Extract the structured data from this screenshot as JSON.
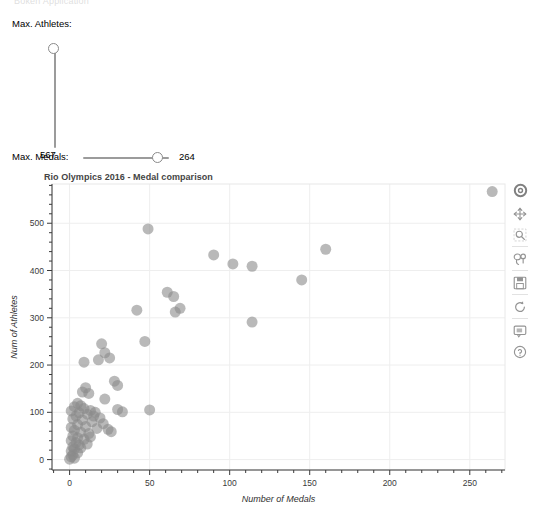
{
  "clipped_header": "Bokeh Application",
  "sliders": {
    "athletes": {
      "label": "Max. Athletes:",
      "value": "567",
      "orientation": "vertical",
      "min": 0,
      "max": 567,
      "handle_name": "max-athletes-slider-handle"
    },
    "medals": {
      "label": "Max. Medals:",
      "value": "264",
      "orientation": "horizontal",
      "min": 0,
      "max": 264,
      "handle_name": "max-medals-slider-handle"
    }
  },
  "toolbar": {
    "items": [
      {
        "icon": "bokeh-logo-icon",
        "label": "Bokeh"
      },
      {
        "icon": "pan-move-icon",
        "label": "Pan"
      },
      {
        "icon": "box-zoom-icon",
        "label": "Box Zoom"
      },
      {
        "icon": "lasso-select-icon",
        "label": "Lasso Select"
      },
      {
        "icon": "save-disk-icon",
        "label": "Save"
      },
      {
        "icon": "reset-icon",
        "label": "Reset"
      },
      {
        "icon": "hover-icon",
        "label": "Hover"
      },
      {
        "icon": "help-icon",
        "label": "Help"
      }
    ]
  },
  "chart_data": {
    "type": "scatter",
    "title": "Rio Olympics 2016 - Medal comparison",
    "xlabel": "Number of Medals",
    "ylabel": "Num of Athletes",
    "xlim": [
      -11,
      272
    ],
    "ylim": [
      -22,
      583
    ],
    "xticks": [
      0,
      50,
      100,
      150,
      200,
      250
    ],
    "yticks": [
      0,
      100,
      200,
      300,
      400,
      500
    ],
    "grid": true,
    "legend": "none",
    "marker": "circle",
    "marker_size": 11,
    "marker_color": "#8a8a8a",
    "marker_alpha": 0.6,
    "points": [
      {
        "x": 264,
        "y": 567
      },
      {
        "x": 49,
        "y": 488
      },
      {
        "x": 90,
        "y": 433
      },
      {
        "x": 160,
        "y": 445
      },
      {
        "x": 102,
        "y": 414
      },
      {
        "x": 114,
        "y": 409
      },
      {
        "x": 145,
        "y": 380
      },
      {
        "x": 61,
        "y": 354
      },
      {
        "x": 65,
        "y": 345
      },
      {
        "x": 42,
        "y": 316
      },
      {
        "x": 69,
        "y": 320
      },
      {
        "x": 66,
        "y": 312
      },
      {
        "x": 114,
        "y": 291
      },
      {
        "x": 47,
        "y": 250
      },
      {
        "x": 20,
        "y": 245
      },
      {
        "x": 22,
        "y": 226
      },
      {
        "x": 25,
        "y": 215
      },
      {
        "x": 18,
        "y": 211
      },
      {
        "x": 9,
        "y": 206
      },
      {
        "x": 28,
        "y": 166
      },
      {
        "x": 30,
        "y": 157
      },
      {
        "x": 10,
        "y": 152
      },
      {
        "x": 8,
        "y": 143
      },
      {
        "x": 12,
        "y": 140
      },
      {
        "x": 22,
        "y": 128
      },
      {
        "x": 50,
        "y": 105
      },
      {
        "x": 30,
        "y": 106
      },
      {
        "x": 33,
        "y": 101
      },
      {
        "x": 5,
        "y": 119
      },
      {
        "x": 7,
        "y": 114
      },
      {
        "x": 3,
        "y": 112
      },
      {
        "x": 9,
        "y": 108
      },
      {
        "x": 13,
        "y": 104
      },
      {
        "x": 1,
        "y": 103
      },
      {
        "x": 16,
        "y": 100
      },
      {
        "x": 6,
        "y": 99
      },
      {
        "x": 11,
        "y": 96
      },
      {
        "x": 4,
        "y": 92
      },
      {
        "x": 19,
        "y": 88
      },
      {
        "x": 2,
        "y": 86
      },
      {
        "x": 8,
        "y": 84
      },
      {
        "x": 14,
        "y": 80
      },
      {
        "x": 26,
        "y": 59
      },
      {
        "x": 5,
        "y": 74
      },
      {
        "x": 10,
        "y": 70
      },
      {
        "x": 1,
        "y": 68
      },
      {
        "x": 17,
        "y": 66
      },
      {
        "x": 3,
        "y": 62
      },
      {
        "x": 7,
        "y": 58
      },
      {
        "x": 12,
        "y": 55
      },
      {
        "x": 2,
        "y": 50
      },
      {
        "x": 5,
        "y": 46
      },
      {
        "x": 9,
        "y": 43
      },
      {
        "x": 1,
        "y": 40
      },
      {
        "x": 4,
        "y": 36
      },
      {
        "x": 6,
        "y": 31
      },
      {
        "x": 2,
        "y": 27
      },
      {
        "x": 3,
        "y": 22
      },
      {
        "x": 1,
        "y": 18
      },
      {
        "x": 5,
        "y": 14
      },
      {
        "x": 2,
        "y": 10
      },
      {
        "x": 1,
        "y": 6
      },
      {
        "x": 3,
        "y": 3
      },
      {
        "x": 0,
        "y": 1
      },
      {
        "x": 15,
        "y": 92
      },
      {
        "x": 21,
        "y": 76
      },
      {
        "x": 24,
        "y": 64
      },
      {
        "x": 11,
        "y": 33
      },
      {
        "x": 7,
        "y": 25
      },
      {
        "x": 13,
        "y": 48
      }
    ]
  }
}
